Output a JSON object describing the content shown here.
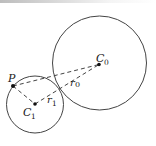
{
  "diagram": {
    "colors": {
      "stroke": "#444444",
      "text": "#222222",
      "background": "#ffffff"
    },
    "circles": [
      {
        "id": "C0",
        "cx": 99.5,
        "cy": 63,
        "r": 47
      },
      {
        "id": "C1",
        "cx": 35,
        "cy": 104.5,
        "r": 28.5
      }
    ],
    "points": [
      {
        "id": "P",
        "x": 13,
        "y": 86
      },
      {
        "id": "C0",
        "x": 99,
        "y": 64.5
      },
      {
        "id": "C1",
        "x": 35,
        "y": 104
      }
    ],
    "labels": {
      "P": "P",
      "C0_main": "C",
      "C0_sub": "0",
      "C1_main": "C",
      "C1_sub": "1",
      "r0_main": "r",
      "r0_sub": "0",
      "r1_main": "r",
      "r1_sub": "1"
    },
    "dashed_segments": [
      {
        "from": "P",
        "to": "C0"
      },
      {
        "from": "P",
        "to": "C1"
      },
      {
        "from": "C1",
        "to": "C0"
      }
    ]
  }
}
